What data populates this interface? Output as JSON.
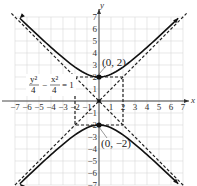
{
  "chart_data": {
    "type": "line",
    "title": "",
    "xlabel": "x",
    "ylabel": "y",
    "xlim": [
      -7,
      7
    ],
    "ylim": [
      -7,
      7
    ],
    "grid": true,
    "x_ticks": [
      -7,
      -6,
      -5,
      -4,
      -3,
      -2,
      -1,
      1,
      2,
      3,
      4,
      5,
      6,
      7
    ],
    "y_ticks": [
      -7,
      -6,
      -5,
      -4,
      -3,
      -2,
      -1,
      1,
      2,
      3,
      4,
      5,
      6,
      7
    ],
    "equation": {
      "numerator_left": "y²",
      "denominator_left": "4",
      "operator": "−",
      "numerator_right": "x²",
      "denominator_right": "4",
      "rhs": "= 1"
    },
    "curve": {
      "name": "hyperbola",
      "a": 2,
      "b": 2,
      "orientation": "vertical",
      "center": [
        0,
        0
      ],
      "vertices": [
        [
          0,
          2
        ],
        [
          0,
          -2
        ]
      ]
    },
    "asymptotes": [
      {
        "name": "y = x",
        "slope": 1
      },
      {
        "name": "y = -x",
        "slope": -1
      }
    ],
    "fundamental_rectangle": {
      "x": [
        -2,
        2
      ],
      "y": [
        -2,
        2
      ],
      "style": "dashed"
    },
    "annotations": [
      {
        "text": "(0, 2)",
        "point": [
          0,
          2
        ]
      },
      {
        "text": "(0, −2)",
        "point": [
          0,
          -2
        ]
      }
    ]
  },
  "labels": {
    "x_axis": "x",
    "y_axis": "y",
    "vertex_top": "(0, 2)",
    "vertex_bottom": "(0, −2)",
    "eq_num_left": "y²",
    "eq_den_left": "4",
    "eq_op": "−",
    "eq_num_right": "x²",
    "eq_den_right": "4",
    "eq_rhs": "= 1"
  },
  "colors": {
    "curve": "#111111",
    "grid": "#d8d8d8",
    "axis": "#333333",
    "asymptote": "#222222",
    "background": "#ffffff"
  }
}
